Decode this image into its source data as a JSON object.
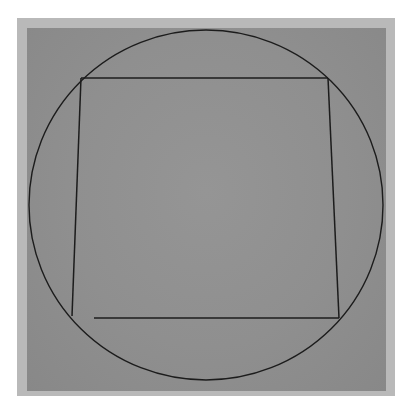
{
  "artwork": {
    "description": "Minimal drawing: a circle enclosing an irregular quadrilateral with an open lower-left corner, on a gray ground",
    "colors": {
      "page_background": "#ffffff",
      "mat_border": "#b9b9b9",
      "ground": "#8f8f8f",
      "line": "#1c1c1c"
    },
    "circle": {
      "cx": 206,
      "cy": 205,
      "rx": 177,
      "ry": 175
    },
    "quadrilateral": {
      "top_left": [
        81,
        78
      ],
      "top_right": [
        328,
        78
      ],
      "bottom_right": [
        339,
        318
      ],
      "bottom_left_open_start": [
        94,
        318
      ],
      "left_line_bottom": [
        72,
        316
      ]
    }
  }
}
